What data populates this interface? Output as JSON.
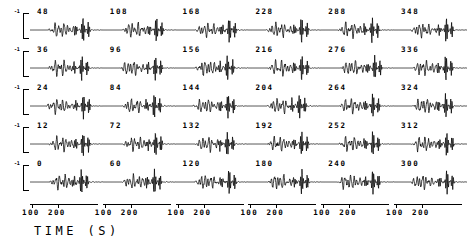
{
  "figure": {
    "type": "seismogram-record-section",
    "x_axis_title": "TIME (S)",
    "x_tick_labels": [
      "100",
      "200"
    ],
    "scale_bar_label": "-1",
    "line_color": "#000000",
    "background_color": "#ffffff"
  },
  "chart_data": {
    "type": "line",
    "title": "",
    "subtitle": "",
    "xlabel": "TIME (S)",
    "ylabel": "",
    "xlim": [
      75,
      265
    ],
    "grid": false,
    "legend": "none",
    "panel_grid": {
      "rows": 5,
      "cols": 6
    },
    "xticks": [
      100,
      200
    ],
    "xticklabels": [
      "100",
      "200"
    ],
    "scale_bar_label": "-1",
    "panel_labels": [
      [
        "48",
        "108",
        "168",
        "228",
        "288",
        "348"
      ],
      [
        "36",
        "96",
        "156",
        "216",
        "276",
        "336"
      ],
      [
        "24",
        "84",
        "144",
        "204",
        "264",
        "324"
      ],
      [
        "12",
        "72",
        "132",
        "192",
        "252",
        "312"
      ],
      [
        "0",
        "60",
        "120",
        "180",
        "240",
        "300"
      ]
    ],
    "panel_label_units": "degrees",
    "series": [
      {
        "name": "48",
        "row": 0,
        "col": 0
      },
      {
        "name": "108",
        "row": 0,
        "col": 1
      },
      {
        "name": "168",
        "row": 0,
        "col": 2
      },
      {
        "name": "228",
        "row": 0,
        "col": 3
      },
      {
        "name": "288",
        "row": 0,
        "col": 4
      },
      {
        "name": "348",
        "row": 0,
        "col": 5
      },
      {
        "name": "36",
        "row": 1,
        "col": 0
      },
      {
        "name": "96",
        "row": 1,
        "col": 1
      },
      {
        "name": "156",
        "row": 1,
        "col": 2
      },
      {
        "name": "216",
        "row": 1,
        "col": 3
      },
      {
        "name": "276",
        "row": 1,
        "col": 4
      },
      {
        "name": "336",
        "row": 1,
        "col": 5
      },
      {
        "name": "24",
        "row": 2,
        "col": 0
      },
      {
        "name": "84",
        "row": 2,
        "col": 1
      },
      {
        "name": "144",
        "row": 2,
        "col": 2
      },
      {
        "name": "204",
        "row": 2,
        "col": 3
      },
      {
        "name": "264",
        "row": 2,
        "col": 4
      },
      {
        "name": "324",
        "row": 2,
        "col": 5
      },
      {
        "name": "12",
        "row": 3,
        "col": 0
      },
      {
        "name": "72",
        "row": 3,
        "col": 1
      },
      {
        "name": "132",
        "row": 3,
        "col": 2
      },
      {
        "name": "192",
        "row": 3,
        "col": 3
      },
      {
        "name": "252",
        "row": 3,
        "col": 4
      },
      {
        "name": "312",
        "row": 3,
        "col": 5
      },
      {
        "name": "0",
        "row": 4,
        "col": 0
      },
      {
        "name": "60",
        "row": 4,
        "col": 1
      },
      {
        "name": "120",
        "row": 4,
        "col": 2
      },
      {
        "name": "180",
        "row": 4,
        "col": 3
      },
      {
        "name": "240",
        "row": 4,
        "col": 4
      },
      {
        "name": "300",
        "row": 4,
        "col": 5
      }
    ]
  }
}
